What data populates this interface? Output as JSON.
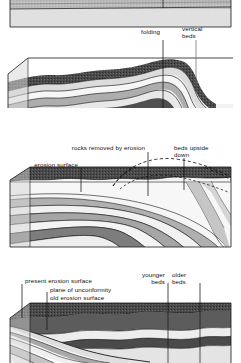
{
  "figure": {
    "panels": [
      {
        "id": "panel-1",
        "name": "flat-lying-beds-block",
        "caption": "",
        "labels": []
      },
      {
        "id": "panel-2",
        "name": "folded-beds-block",
        "caption": "",
        "labels": [
          {
            "key": "folding",
            "text": "folding"
          },
          {
            "key": "vertical_beds_line1",
            "text": "vertical"
          },
          {
            "key": "vertical_beds_line2",
            "text": "beds"
          }
        ]
      },
      {
        "id": "panel-3",
        "name": "eroded-fold-block",
        "caption": "",
        "labels": [
          {
            "key": "rocks_removed",
            "text": "rocks removed by erosion"
          },
          {
            "key": "beds_upside_line1",
            "text": "beds upside"
          },
          {
            "key": "beds_upside_line2",
            "text": "down"
          },
          {
            "key": "erosion_surface",
            "text": "erosion surface"
          }
        ]
      },
      {
        "id": "panel-4",
        "name": "unconformity-block",
        "caption": "",
        "labels": [
          {
            "key": "present_erosion_surface",
            "text": "present erosion surface"
          },
          {
            "key": "plane_of_unconformity",
            "text": "plane of unconformity"
          },
          {
            "key": "old_erosion_surface",
            "text": "old erosion surface"
          },
          {
            "key": "younger_beds_line1",
            "text": "younger"
          },
          {
            "key": "younger_beds_line2",
            "text": "beds"
          },
          {
            "key": "older_beds_line1",
            "text": "older"
          },
          {
            "key": "older_beds_line2",
            "text": "beds"
          }
        ]
      }
    ],
    "colors": {
      "background": "#ffffff",
      "outline": "#161616",
      "bed_very_light": "#f2f2f2",
      "bed_light": "#e2e2e2",
      "bed_mid_light": "#c9c9c9",
      "bed_mid": "#a8a8a8",
      "bed_dark": "#6e6e6e",
      "bed_very_dark": "#3a3a3a",
      "top_surface": "#d8d8d8",
      "side_face": "#cfcfcf",
      "label_text": "#111111",
      "leader_line": "#111111"
    }
  }
}
